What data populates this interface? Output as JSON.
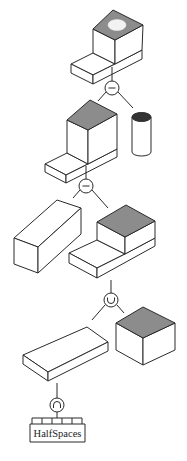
{
  "diagram": {
    "type": "CSG tree",
    "colors": {
      "line": "#2a2a2a",
      "shaded_face": "#8c8c8c",
      "hole": "#f2f2f2",
      "cylinder_top": "#333333",
      "background": "#ffffff"
    },
    "nodes": [
      {
        "id": "op1",
        "operator": "difference",
        "symbol": "−"
      },
      {
        "id": "op2",
        "operator": "difference",
        "symbol": "−"
      },
      {
        "id": "op3",
        "operator": "union",
        "symbol": "∪"
      },
      {
        "id": "op4",
        "operator": "intersection",
        "symbol": "∩"
      }
    ],
    "solids": [
      {
        "id": "result",
        "shape": "stepped block with hole"
      },
      {
        "id": "stepped-block-1",
        "shape": "stepped block"
      },
      {
        "id": "cylinder",
        "shape": "cylinder"
      },
      {
        "id": "long-box",
        "shape": "rectangular prism"
      },
      {
        "id": "stepped-block-2",
        "shape": "stepped block"
      },
      {
        "id": "slab",
        "shape": "flat slab"
      },
      {
        "id": "cube",
        "shape": "cube"
      }
    ],
    "leaf": {
      "label": "HalfSpaces",
      "comb_cells": 5
    }
  }
}
